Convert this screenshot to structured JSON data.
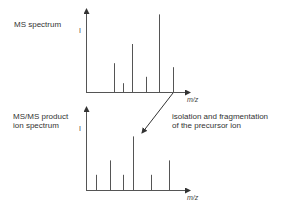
{
  "top_label": "MS spectrum",
  "bottom_label_line1": "MS/MS product",
  "bottom_label_line2": "ion spectrum",
  "annotation_line1": "isolation and fragmentation",
  "annotation_line2": "of the precursor ion",
  "y_axis_label": "I",
  "x_axis_label": "m/z",
  "colors": {
    "line": "#555555",
    "text": "#333333"
  },
  "ms_spectrum_peaks": [
    {
      "mz": 0.27,
      "intensity": 0.36
    },
    {
      "mz": 0.36,
      "intensity": 0.11
    },
    {
      "mz": 0.45,
      "intensity": 0.6
    },
    {
      "mz": 0.59,
      "intensity": 0.19
    },
    {
      "mz": 0.72,
      "intensity": 0.97
    },
    {
      "mz": 0.86,
      "intensity": 0.31,
      "precursor": true
    }
  ],
  "msms_spectrum_peaks": [
    {
      "mz": 0.09,
      "intensity": 0.19
    },
    {
      "mz": 0.23,
      "intensity": 0.37
    },
    {
      "mz": 0.36,
      "intensity": 0.19
    },
    {
      "mz": 0.46,
      "intensity": 0.67
    },
    {
      "mz": 0.64,
      "intensity": 0.19
    },
    {
      "mz": 0.82,
      "intensity": 0.37
    }
  ]
}
